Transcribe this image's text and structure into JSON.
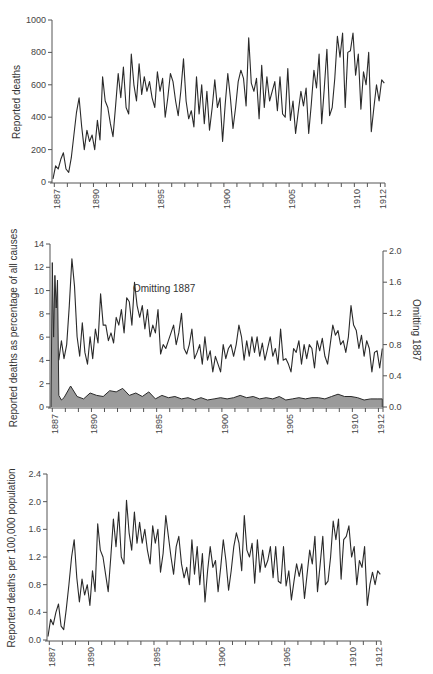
{
  "chart_data": [
    {
      "type": "line",
      "title": "",
      "xlabel": "",
      "ylabel": "Reported deaths",
      "ylim": [
        0,
        1000
      ],
      "yticks": [
        0,
        200,
        400,
        600,
        800,
        1000
      ],
      "xticks": [
        "1887",
        "1890",
        "1895",
        "1900",
        "1905",
        "1910",
        "1912"
      ],
      "grid": false,
      "series": [
        {
          "name": "Reported deaths",
          "x": [
            1887.0,
            1887.2,
            1887.4,
            1887.6,
            1887.8,
            1888.0,
            1888.2,
            1888.4,
            1888.6,
            1888.8,
            1889.0,
            1889.2,
            1889.4,
            1889.6,
            1889.8,
            1890.0,
            1890.2,
            1890.4,
            1890.6,
            1890.8,
            1891.0,
            1891.2,
            1891.4,
            1891.6,
            1891.8,
            1892.0,
            1892.2,
            1892.4,
            1892.6,
            1892.8,
            1893.0,
            1893.2,
            1893.4,
            1893.6,
            1893.8,
            1894.0,
            1894.2,
            1894.4,
            1894.6,
            1894.8,
            1895.0,
            1895.2,
            1895.4,
            1895.6,
            1895.8,
            1896.0,
            1896.2,
            1896.4,
            1896.6,
            1896.8,
            1897.0,
            1897.2,
            1897.4,
            1897.6,
            1897.8,
            1898.0,
            1898.2,
            1898.4,
            1898.6,
            1898.8,
            1899.0,
            1899.2,
            1899.4,
            1899.6,
            1899.8,
            1900.0,
            1900.2,
            1900.4,
            1900.6,
            1900.8,
            1901.0,
            1901.2,
            1901.4,
            1901.6,
            1901.8,
            1902.0,
            1902.2,
            1902.4,
            1902.6,
            1902.8,
            1903.0,
            1903.2,
            1903.4,
            1903.6,
            1903.8,
            1904.0,
            1904.2,
            1904.4,
            1904.6,
            1904.8,
            1905.0,
            1905.2,
            1905.4,
            1905.6,
            1905.8,
            1906.0,
            1906.2,
            1906.4,
            1906.6,
            1906.8,
            1907.0,
            1907.2,
            1907.4,
            1907.6,
            1907.8,
            1908.0,
            1908.2,
            1908.4,
            1908.6,
            1908.8,
            1909.0,
            1909.2,
            1909.4,
            1909.6,
            1909.8,
            1910.0,
            1910.2,
            1910.4,
            1910.6,
            1910.8,
            1911.0,
            1911.2,
            1911.4,
            1911.6,
            1911.8,
            1912.0,
            1912.2,
            1912.4
          ],
          "values": [
            20,
            100,
            80,
            140,
            180,
            80,
            60,
            150,
            290,
            430,
            520,
            340,
            200,
            320,
            250,
            290,
            200,
            380,
            260,
            650,
            500,
            460,
            360,
            280,
            470,
            670,
            520,
            710,
            460,
            420,
            790,
            600,
            500,
            730,
            540,
            650,
            560,
            620,
            520,
            460,
            680,
            560,
            640,
            400,
            520,
            670,
            620,
            500,
            410,
            560,
            760,
            500,
            390,
            440,
            340,
            650,
            420,
            600,
            360,
            560,
            320,
            460,
            630,
            460,
            520,
            250,
            480,
            670,
            520,
            330,
            460,
            620,
            690,
            640,
            470,
            890,
            610,
            560,
            640,
            390,
            720,
            460,
            650,
            500,
            560,
            620,
            440,
            650,
            420,
            400,
            700,
            380,
            500,
            300,
            430,
            560,
            470,
            580,
            300,
            480,
            690,
            580,
            790,
            360,
            580,
            820,
            410,
            460,
            640,
            900,
            770,
            920,
            460,
            800,
            810,
            920,
            660,
            790,
            450,
            680,
            600,
            800,
            310,
            460,
            600,
            500,
            630,
            610,
            380,
            0
          ]
        }
      ]
    },
    {
      "type": "area",
      "title": "",
      "xlabel": "",
      "ylabel": "Reported deaths as percentage of all causes",
      "ylabel_right": "Omitting 1887",
      "ylim": [
        0,
        14
      ],
      "ylim_right": [
        0.0,
        2.0
      ],
      "yticks": [
        0,
        2,
        4,
        6,
        8,
        10,
        12,
        14
      ],
      "yticks_right": [
        "0.0",
        "0.4",
        "0.8",
        "1.2",
        "1.6",
        "2.0"
      ],
      "xticks": [
        "1887",
        "1890",
        "1895",
        "1900",
        "1905",
        "1910",
        "1912"
      ],
      "annotation": "Omitting 1887",
      "grid": false,
      "series": [
        {
          "name": "All years (left axis, shaded)",
          "x": [
            1887.0,
            1887.1,
            1887.2,
            1887.3,
            1887.4,
            1887.5,
            1887.6,
            1887.7,
            1887.8,
            1887.9,
            1888.0,
            1888.5,
            1889.0,
            1889.5,
            1890.0,
            1890.5,
            1891.0,
            1891.5,
            1892.0,
            1892.5,
            1893.0,
            1893.5,
            1894.0,
            1894.5,
            1895.0,
            1895.5,
            1896.0,
            1896.5,
            1897.0,
            1897.5,
            1898.0,
            1898.5,
            1899.0,
            1899.5,
            1900.0,
            1900.5,
            1901.0,
            1901.5,
            1902.0,
            1902.5,
            1903.0,
            1903.5,
            1904.0,
            1904.5,
            1905.0,
            1905.5,
            1906.0,
            1906.5,
            1907.0,
            1907.5,
            1908.0,
            1908.5,
            1909.0,
            1909.5,
            1910.0,
            1910.5,
            1911.0,
            1911.5,
            1912.0,
            1912.4
          ],
          "values": [
            0,
            12.4,
            6,
            11.3,
            8.5,
            10.9,
            1,
            0.8,
            0.6,
            0.7,
            0.8,
            1.8,
            0.9,
            0.7,
            1.2,
            1.0,
            0.9,
            1.4,
            1.3,
            1.6,
            1.0,
            1.2,
            0.9,
            1.3,
            0.7,
            1.0,
            0.8,
            0.9,
            0.7,
            0.8,
            0.6,
            0.8,
            0.6,
            0.7,
            0.8,
            0.7,
            0.8,
            1.0,
            0.8,
            0.9,
            0.7,
            0.8,
            0.7,
            0.9,
            0.6,
            0.7,
            0.8,
            0.7,
            0.8,
            0.8,
            0.7,
            0.9,
            1.1,
            0.9,
            0.9,
            0.8,
            0.6,
            0.7,
            0.7,
            0.7
          ]
        },
        {
          "name": "Omitting 1887 (right axis)",
          "x": [
            1887.6,
            1887.8,
            1888.0,
            1888.2,
            1888.4,
            1888.6,
            1888.8,
            1889.0,
            1889.2,
            1889.4,
            1889.6,
            1889.8,
            1890.0,
            1890.2,
            1890.4,
            1890.6,
            1890.8,
            1891.0,
            1891.2,
            1891.4,
            1891.6,
            1891.8,
            1892.0,
            1892.2,
            1892.4,
            1892.6,
            1892.8,
            1893.0,
            1893.2,
            1893.4,
            1893.6,
            1893.8,
            1894.0,
            1894.2,
            1894.4,
            1894.6,
            1894.8,
            1895.0,
            1895.2,
            1895.4,
            1895.6,
            1895.8,
            1896.0,
            1896.2,
            1896.4,
            1896.6,
            1896.8,
            1897.0,
            1897.2,
            1897.4,
            1897.6,
            1897.8,
            1898.0,
            1898.2,
            1898.4,
            1898.6,
            1898.8,
            1899.0,
            1899.2,
            1899.4,
            1899.6,
            1899.8,
            1900.0,
            1900.2,
            1900.4,
            1900.6,
            1900.8,
            1901.0,
            1901.2,
            1901.4,
            1901.6,
            1901.8,
            1902.0,
            1902.2,
            1902.4,
            1902.6,
            1902.8,
            1903.0,
            1903.2,
            1903.4,
            1903.6,
            1903.8,
            1904.0,
            1904.2,
            1904.4,
            1904.6,
            1904.8,
            1905.0,
            1905.2,
            1905.4,
            1905.6,
            1905.8,
            1906.0,
            1906.2,
            1906.4,
            1906.6,
            1906.8,
            1907.0,
            1907.2,
            1907.4,
            1907.6,
            1907.8,
            1908.0,
            1908.2,
            1908.4,
            1908.6,
            1908.8,
            1909.0,
            1909.2,
            1909.4,
            1909.6,
            1909.8,
            1910.0,
            1910.2,
            1910.4,
            1910.6,
            1910.8,
            1911.0,
            1911.2,
            1911.4,
            1911.6,
            1911.8,
            1912.0,
            1912.2,
            1912.4
          ],
          "values": [
            0.6,
            0.85,
            0.62,
            0.8,
            1.3,
            1.9,
            1.55,
            0.9,
            0.65,
            1.08,
            0.7,
            0.55,
            0.9,
            0.62,
            1.0,
            0.82,
            1.45,
            1.05,
            1.05,
            0.85,
            0.95,
            0.82,
            1.15,
            1.05,
            1.25,
            0.95,
            1.4,
            1.35,
            1.05,
            1.6,
            1.3,
            1.15,
            1.3,
            1.0,
            1.25,
            0.9,
            1.05,
            0.95,
            1.25,
            0.68,
            0.8,
            0.75,
            0.85,
            0.95,
            1.05,
            0.8,
            0.95,
            1.2,
            0.75,
            0.68,
            0.8,
            1.0,
            0.62,
            0.7,
            0.8,
            0.55,
            0.9,
            0.6,
            0.72,
            0.45,
            0.65,
            0.55,
            0.45,
            0.8,
            0.62,
            0.75,
            0.8,
            0.65,
            0.8,
            1.05,
            0.9,
            0.6,
            0.85,
            0.65,
            0.9,
            0.7,
            0.9,
            0.65,
            0.82,
            0.6,
            0.75,
            0.9,
            0.65,
            0.75,
            0.55,
            1.0,
            0.6,
            0.62,
            0.55,
            0.45,
            0.75,
            0.7,
            0.85,
            0.55,
            0.8,
            0.62,
            0.8,
            0.75,
            0.5,
            0.85,
            0.72,
            0.88,
            0.65,
            0.55,
            0.8,
            1.05,
            0.92,
            0.98,
            0.8,
            0.85,
            0.7,
            0.9,
            1.3,
            1.05,
            0.98,
            0.75,
            0.92,
            0.65,
            0.85,
            0.75,
            0.45,
            0.7,
            0.72,
            0.5,
            0.75
          ]
        }
      ]
    },
    {
      "type": "line",
      "title": "",
      "xlabel": "",
      "ylabel": "Reported deaths per 100,000 population",
      "ylim": [
        0.0,
        2.4
      ],
      "yticks": [
        "0.0",
        "0.4",
        "0.8",
        "1.2",
        "1.6",
        "2.0",
        "2.4"
      ],
      "xticks": [
        "1887",
        "1890",
        "1895",
        "1900",
        "1905",
        "1910",
        "1912"
      ],
      "grid": false,
      "series": [
        {
          "name": "Reported deaths per 100,000 population",
          "x": [
            1887.0,
            1887.2,
            1887.4,
            1887.6,
            1887.8,
            1888.0,
            1888.2,
            1888.4,
            1888.6,
            1888.8,
            1889.0,
            1889.2,
            1889.4,
            1889.6,
            1889.8,
            1890.0,
            1890.2,
            1890.4,
            1890.6,
            1890.8,
            1891.0,
            1891.2,
            1891.4,
            1891.6,
            1891.8,
            1892.0,
            1892.2,
            1892.4,
            1892.6,
            1892.8,
            1893.0,
            1893.2,
            1893.4,
            1893.6,
            1893.8,
            1894.0,
            1894.2,
            1894.4,
            1894.6,
            1894.8,
            1895.0,
            1895.2,
            1895.4,
            1895.6,
            1895.8,
            1896.0,
            1896.2,
            1896.4,
            1896.6,
            1896.8,
            1897.0,
            1897.2,
            1897.4,
            1897.6,
            1897.8,
            1898.0,
            1898.2,
            1898.4,
            1898.6,
            1898.8,
            1899.0,
            1899.2,
            1899.4,
            1899.6,
            1899.8,
            1900.0,
            1900.2,
            1900.4,
            1900.6,
            1900.8,
            1901.0,
            1901.2,
            1901.4,
            1901.6,
            1901.8,
            1902.0,
            1902.2,
            1902.4,
            1902.6,
            1902.8,
            1903.0,
            1903.2,
            1903.4,
            1903.6,
            1903.8,
            1904.0,
            1904.2,
            1904.4,
            1904.6,
            1904.8,
            1905.0,
            1905.2,
            1905.4,
            1905.6,
            1905.8,
            1906.0,
            1906.2,
            1906.4,
            1906.6,
            1906.8,
            1907.0,
            1907.2,
            1907.4,
            1907.6,
            1907.8,
            1908.0,
            1908.2,
            1908.4,
            1908.6,
            1908.8,
            1909.0,
            1909.2,
            1909.4,
            1909.6,
            1909.8,
            1910.0,
            1910.2,
            1910.4,
            1910.6,
            1910.8,
            1911.0,
            1911.2,
            1911.4,
            1911.6,
            1911.8,
            1912.0,
            1912.2,
            1912.4
          ],
          "values": [
            0.05,
            0.3,
            0.22,
            0.4,
            0.52,
            0.2,
            0.15,
            0.45,
            0.8,
            1.2,
            1.45,
            0.9,
            0.55,
            0.88,
            0.65,
            0.8,
            0.5,
            1.0,
            0.7,
            1.68,
            1.3,
            1.2,
            0.95,
            0.7,
            1.2,
            1.75,
            1.35,
            1.85,
            1.2,
            1.1,
            2.02,
            1.55,
            1.3,
            1.85,
            1.4,
            1.7,
            1.4,
            1.6,
            1.3,
            1.1,
            1.65,
            1.4,
            1.6,
            0.98,
            1.25,
            1.8,
            1.5,
            1.2,
            0.95,
            1.35,
            1.5,
            1.1,
            0.9,
            1.05,
            0.8,
            1.45,
            0.95,
            1.35,
            0.8,
            1.25,
            0.55,
            1.0,
            1.35,
            1.05,
            1.15,
            0.7,
            1.05,
            1.45,
            1.15,
            0.72,
            1.0,
            1.35,
            1.55,
            1.4,
            1.0,
            1.8,
            1.3,
            1.2,
            1.4,
            0.82,
            1.45,
            0.98,
            1.3,
            1.05,
            1.15,
            1.35,
            0.9,
            1.35,
            0.85,
            0.82,
            1.35,
            0.78,
            1.0,
            0.58,
            0.85,
            1.1,
            0.92,
            1.1,
            0.6,
            0.95,
            1.3,
            1.1,
            1.5,
            0.7,
            1.1,
            1.5,
            0.8,
            0.85,
            1.2,
            1.72,
            1.45,
            1.75,
            0.88,
            1.45,
            1.5,
            1.65,
            1.2,
            1.35,
            0.8,
            1.15,
            1.05,
            1.35,
            0.5,
            0.8,
            0.98,
            0.8,
            1.0,
            0.95,
            0.62,
            0.0
          ]
        }
      ]
    }
  ],
  "charts": [
    {
      "ylabel": "Reported deaths",
      "yticks": [
        "0",
        "200",
        "400",
        "600",
        "800",
        "1000"
      ],
      "xticks": [
        "1887",
        "1890",
        "1895",
        "1900",
        "1905",
        "1910",
        "1912"
      ]
    },
    {
      "ylabel": "Reported deaths as percentage of all causes",
      "ylabel_right": "Omitting 1887",
      "annotation": "Omitting 1887",
      "yticks": [
        "0",
        "2",
        "4",
        "6",
        "8",
        "10",
        "12",
        "14"
      ],
      "yticks_right": [
        "0.0",
        "0.4",
        "0.8",
        "1.2",
        "1.6",
        "2.0"
      ],
      "xticks": [
        "1887",
        "1890",
        "1895",
        "1900",
        "1905",
        "1910",
        "1912"
      ]
    },
    {
      "ylabel": "Reported deaths per 100,000 population",
      "yticks": [
        "0.0",
        "0.4",
        "0.8",
        "1.2",
        "1.6",
        "2.0",
        "2.4"
      ],
      "xticks": [
        "1887",
        "1890",
        "1895",
        "1900",
        "1905",
        "1910",
        "1912"
      ]
    }
  ]
}
